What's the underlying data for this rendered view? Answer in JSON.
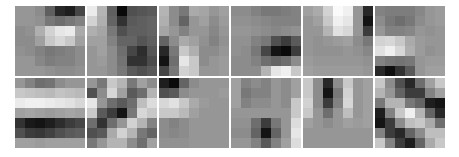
{
  "grid": {
    "rows": 2,
    "cols": 6,
    "kernel_size": 7
  },
  "filters": [
    {
      "pixels": [
        [
          150,
          150,
          140,
          95,
          40,
          30,
          70
        ],
        [
          150,
          150,
          145,
          120,
          110,
          120,
          130
        ],
        [
          140,
          145,
          175,
          210,
          230,
          235,
          170
        ],
        [
          140,
          140,
          160,
          200,
          215,
          200,
          160
        ],
        [
          145,
          140,
          130,
          120,
          125,
          130,
          140
        ],
        [
          150,
          150,
          135,
          125,
          130,
          130,
          140
        ],
        [
          150,
          150,
          150,
          145,
          140,
          140,
          145
        ]
      ]
    },
    {
      "pixels": [
        [
          235,
          180,
          95,
          10,
          80,
          85,
          90
        ],
        [
          210,
          175,
          100,
          50,
          90,
          95,
          100
        ],
        [
          175,
          165,
          120,
          80,
          95,
          95,
          100
        ],
        [
          160,
          160,
          130,
          100,
          100,
          85,
          95
        ],
        [
          150,
          160,
          140,
          110,
          70,
          45,
          85
        ],
        [
          150,
          155,
          140,
          115,
          50,
          50,
          75
        ],
        [
          150,
          150,
          140,
          120,
          90,
          80,
          90
        ]
      ]
    },
    {
      "pixels": [
        [
          180,
          140,
          120,
          170,
          165,
          150,
          160
        ],
        [
          175,
          140,
          100,
          150,
          160,
          140,
          155
        ],
        [
          165,
          150,
          130,
          150,
          150,
          135,
          150
        ],
        [
          100,
          140,
          170,
          160,
          145,
          130,
          145
        ],
        [
          40,
          120,
          200,
          175,
          140,
          140,
          150
        ],
        [
          20,
          110,
          230,
          200,
          140,
          150,
          155
        ],
        [
          70,
          120,
          210,
          200,
          150,
          150,
          155
        ]
      ]
    },
    {
      "pixels": [
        [
          140,
          140,
          130,
          120,
          120,
          125,
          130
        ],
        [
          145,
          145,
          140,
          135,
          130,
          130,
          130
        ],
        [
          150,
          150,
          145,
          140,
          135,
          140,
          145
        ],
        [
          145,
          145,
          130,
          120,
          80,
          60,
          90
        ],
        [
          145,
          140,
          120,
          70,
          20,
          10,
          60
        ],
        [
          140,
          140,
          130,
          110,
          100,
          110,
          140
        ],
        [
          140,
          140,
          140,
          180,
          230,
          240,
          200
        ]
      ]
    },
    {
      "pixels": [
        [
          160,
          170,
          210,
          250,
          240,
          150,
          40
        ],
        [
          150,
          160,
          200,
          240,
          230,
          150,
          20
        ],
        [
          150,
          150,
          180,
          225,
          215,
          150,
          60
        ],
        [
          150,
          145,
          150,
          155,
          160,
          140,
          120
        ],
        [
          150,
          145,
          145,
          145,
          150,
          145,
          135
        ],
        [
          155,
          150,
          150,
          150,
          150,
          150,
          145
        ],
        [
          160,
          155,
          155,
          155,
          155,
          155,
          150
        ]
      ]
    },
    {
      "pixels": [
        [
          130,
          125,
          125,
          125,
          135,
          150,
          155
        ],
        [
          140,
          120,
          110,
          120,
          140,
          150,
          155
        ],
        [
          150,
          130,
          130,
          135,
          150,
          145,
          150
        ],
        [
          210,
          215,
          200,
          170,
          155,
          150,
          150
        ],
        [
          225,
          240,
          215,
          175,
          155,
          145,
          150
        ],
        [
          130,
          120,
          115,
          120,
          150,
          155,
          155
        ],
        [
          40,
          15,
          50,
          90,
          150,
          160,
          160
        ]
      ]
    },
    {
      "pixels": [
        [
          150,
          130,
          110,
          115,
          140,
          150,
          150
        ],
        [
          200,
          195,
          190,
          185,
          195,
          190,
          185
        ],
        [
          235,
          240,
          240,
          235,
          230,
          225,
          215
        ],
        [
          160,
          165,
          160,
          155,
          160,
          165,
          160
        ],
        [
          50,
          25,
          20,
          30,
          45,
          60,
          70
        ],
        [
          80,
          60,
          55,
          65,
          80,
          90,
          95
        ],
        [
          160,
          160,
          155,
          160,
          160,
          160,
          160
        ]
      ]
    },
    {
      "pixels": [
        [
          150,
          120,
          200,
          180,
          120,
          160,
          140
        ],
        [
          80,
          140,
          215,
          160,
          90,
          110,
          180
        ],
        [
          230,
          150,
          110,
          90,
          110,
          190,
          220
        ],
        [
          200,
          90,
          60,
          20,
          120,
          215,
          200
        ],
        [
          110,
          50,
          110,
          150,
          210,
          180,
          130
        ],
        [
          80,
          90,
          170,
          210,
          180,
          120,
          100
        ],
        [
          120,
          150,
          180,
          180,
          140,
          110,
          160
        ]
      ]
    },
    {
      "pixels": [
        [
          30,
          10,
          100,
          140,
          150,
          150,
          150
        ],
        [
          80,
          90,
          140,
          150,
          150,
          150,
          155
        ],
        [
          215,
          225,
          200,
          170,
          155,
          150,
          150
        ],
        [
          200,
          200,
          185,
          160,
          150,
          150,
          150
        ],
        [
          140,
          130,
          140,
          150,
          150,
          150,
          150
        ],
        [
          140,
          135,
          140,
          150,
          150,
          150,
          150
        ],
        [
          145,
          145,
          145,
          150,
          150,
          150,
          150
        ]
      ]
    },
    {
      "pixels": [
        [
          160,
          130,
          140,
          130,
          150,
          140,
          160
        ],
        [
          160,
          120,
          130,
          130,
          150,
          140,
          160
        ],
        [
          160,
          130,
          140,
          140,
          150,
          140,
          200
        ],
        [
          150,
          150,
          150,
          150,
          150,
          150,
          200
        ],
        [
          145,
          145,
          110,
          60,
          120,
          150,
          220
        ],
        [
          140,
          140,
          100,
          20,
          100,
          150,
          230
        ],
        [
          150,
          150,
          130,
          90,
          130,
          160,
          220
        ]
      ]
    },
    {
      "pixels": [
        [
          200,
          140,
          40,
          140,
          200,
          150,
          160
        ],
        [
          200,
          140,
          20,
          120,
          210,
          150,
          160
        ],
        [
          210,
          140,
          60,
          130,
          215,
          150,
          160
        ],
        [
          200,
          150,
          110,
          150,
          190,
          150,
          160
        ],
        [
          160,
          150,
          140,
          150,
          160,
          155,
          160
        ],
        [
          150,
          150,
          150,
          150,
          150,
          150,
          150
        ],
        [
          150,
          150,
          150,
          150,
          150,
          150,
          150
        ]
      ]
    },
    {
      "pixels": [
        [
          200,
          140,
          80,
          40,
          110,
          160,
          200
        ],
        [
          180,
          150,
          100,
          60,
          60,
          130,
          160
        ],
        [
          120,
          180,
          180,
          120,
          100,
          30,
          20
        ],
        [
          30,
          130,
          200,
          240,
          180,
          100,
          40
        ],
        [
          20,
          60,
          140,
          190,
          200,
          170,
          110
        ],
        [
          130,
          60,
          40,
          100,
          140,
          190,
          190
        ],
        [
          200,
          130,
          60,
          30,
          100,
          170,
          200
        ]
      ]
    }
  ]
}
